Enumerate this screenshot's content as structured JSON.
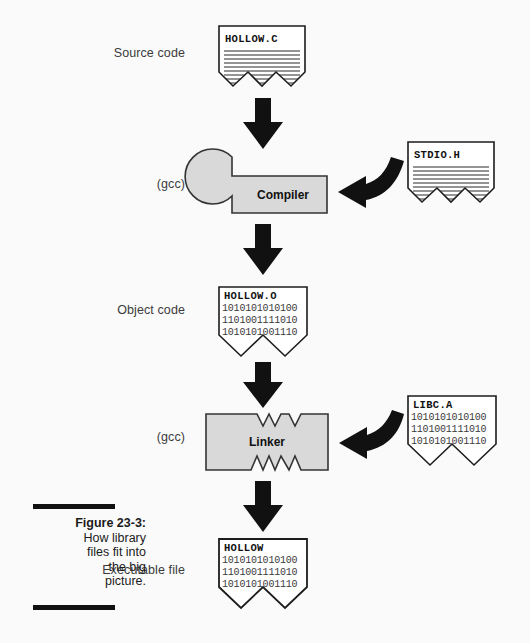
{
  "figure": {
    "number": "Figure 23-3:",
    "text_lines": [
      "How library",
      "files fit into",
      "the big",
      "picture."
    ]
  },
  "stage_labels": [
    {
      "name": "source-code",
      "text": "Source code",
      "x": 45,
      "y": 53
    },
    {
      "name": "compiler-gcc",
      "text": "(gcc)",
      "x": 45,
      "y": 184
    },
    {
      "name": "object-code",
      "text": "Object code",
      "x": 45,
      "y": 310
    },
    {
      "name": "linker-gcc",
      "text": "(gcc)",
      "x": 45,
      "y": 437
    },
    {
      "name": "executable-file",
      "text": "Executable file",
      "x": 45,
      "y": 570
    }
  ],
  "files": {
    "source": {
      "name": "HOLLOW.C",
      "type": "text",
      "lines": []
    },
    "header": {
      "name": "STDIO.H",
      "type": "text",
      "lines": []
    },
    "object": {
      "name": "HOLLOW.O",
      "type": "binary",
      "lines": [
        "1010101010100",
        "1101001111010",
        "1010101001110"
      ]
    },
    "library": {
      "name": "LIBC.A",
      "type": "binary",
      "lines": [
        "1010101010100",
        "1101001111010",
        "1010101001110"
      ]
    },
    "executable": {
      "name": "HOLLOW",
      "type": "binary",
      "lines": [
        "1010101010100",
        "1101001111010",
        "1010101001110"
      ]
    }
  },
  "process_boxes": {
    "compiler": {
      "label": "Compiler"
    },
    "linker": {
      "label": "Linker"
    }
  },
  "colors": {
    "background": "#fafafa",
    "ink": "#111111",
    "box_fill": "#d9d9d9",
    "box_stroke": "#333333",
    "label_text": "#3b3b3b",
    "binary_text": "#3a3a3a"
  }
}
